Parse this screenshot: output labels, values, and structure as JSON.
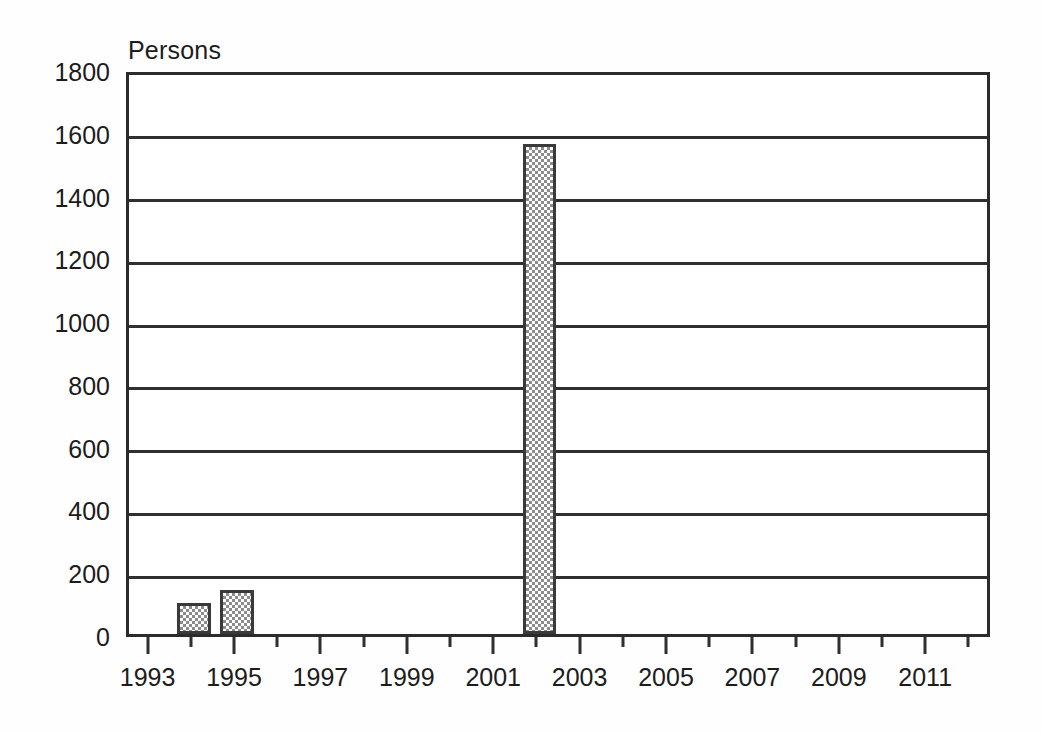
{
  "chart_data": {
    "type": "bar",
    "title": "",
    "subtitle": "",
    "xlabel": "",
    "ylabel": "Persons",
    "ylim": [
      0,
      1800
    ],
    "xlim": [
      1992.5,
      2012.5
    ],
    "ytick_values": [
      0,
      200,
      400,
      600,
      800,
      1000,
      1200,
      1400,
      1600,
      1800
    ],
    "ytick_labels": [
      "0",
      "200",
      "400",
      "600",
      "800",
      "1000",
      "1200",
      "1400",
      "1600",
      "1800"
    ],
    "xtick_labels": [
      "1993",
      "1995",
      "1997",
      "1999",
      "2001",
      "2003",
      "2005",
      "2007",
      "2009",
      "2011"
    ],
    "xtick_values": [
      1993,
      1995,
      1997,
      1999,
      2001,
      2003,
      2005,
      2007,
      2009,
      2011
    ],
    "xtick_minor_values": [
      1994,
      1996,
      1998,
      2000,
      2002,
      2004,
      2006,
      2008,
      2010,
      2012
    ],
    "grid": true,
    "grid_axis": "y",
    "legend": false,
    "legend_position": "none",
    "categories": [
      1993,
      1994,
      1995,
      1996,
      1997,
      1998,
      1999,
      2000,
      2001,
      2002,
      2003,
      2004,
      2005,
      2006,
      2007,
      2008,
      2009,
      2010,
      2011,
      2012
    ],
    "values": [
      0,
      100,
      140,
      0,
      0,
      0,
      0,
      0,
      0,
      1560,
      0,
      0,
      0,
      0,
      0,
      0,
      0,
      0,
      0,
      0
    ],
    "bars": [
      {
        "x": 1994,
        "value": 100
      },
      {
        "x": 1995,
        "value": 140
      },
      {
        "x": 2002,
        "value": 1560
      }
    ],
    "bar_fill": "#8c8c8c",
    "bar_fill_style": "checkerboard-dither",
    "bar_edge_color": "#3a3a3a",
    "axis_color": "#2f2f2f",
    "background_color": "#ffffff",
    "text_color": "#1c1c1c"
  }
}
